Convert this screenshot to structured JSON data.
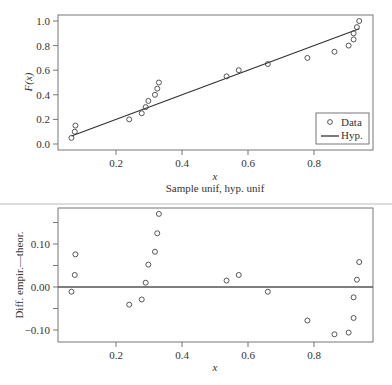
{
  "chart_data": [
    {
      "type": "scatter",
      "title": "",
      "subtitle": "Sample unif, hyp. unif",
      "xlabel": "x",
      "ylabel": "F(x)",
      "xlim": [
        0.04,
        0.97
      ],
      "ylim": [
        -0.02,
        1.02
      ],
      "xticks": [
        0.2,
        0.4,
        0.6,
        0.8
      ],
      "xtick_labels": [
        "0.2",
        "0.4",
        "0.6",
        "0.8"
      ],
      "yticks": [
        0.0,
        0.2,
        0.4,
        0.6,
        0.8,
        1.0
      ],
      "ytick_labels": [
        "0.0",
        "0.2",
        "0.4",
        "0.6",
        "0.8",
        "1.0"
      ],
      "grid": false,
      "legend_position": "lower right",
      "series": [
        {
          "name": "Data",
          "style": "open-circle",
          "x": [
            0.065,
            0.075,
            0.077,
            0.24,
            0.278,
            0.29,
            0.298,
            0.318,
            0.325,
            0.33,
            0.535,
            0.572,
            0.66,
            0.78,
            0.862,
            0.905,
            0.92,
            0.92,
            0.93,
            0.937
          ],
          "y": [
            0.05,
            0.1,
            0.15,
            0.2,
            0.25,
            0.3,
            0.35,
            0.4,
            0.45,
            0.5,
            0.55,
            0.6,
            0.65,
            0.7,
            0.75,
            0.8,
            0.85,
            0.9,
            0.95,
            1.0
          ]
        },
        {
          "name": "Hyp.",
          "style": "line",
          "x": [
            0.065,
            0.937
          ],
          "y": [
            0.065,
            0.937
          ]
        }
      ]
    },
    {
      "type": "scatter",
      "title": "",
      "xlabel": "x",
      "ylabel": "Diff. empir.—theor.",
      "xlim": [
        0.04,
        0.97
      ],
      "ylim": [
        -0.125,
        0.185
      ],
      "xticks": [
        0.2,
        0.4,
        0.6,
        0.8
      ],
      "xtick_labels": [
        "0.2",
        "0.4",
        "0.6",
        "0.8"
      ],
      "yticks": [
        -0.1,
        -0.05,
        0.0,
        0.05,
        0.1,
        0.15
      ],
      "ytick_labels": [
        "−0.10",
        "",
        "0.00",
        "",
        "0.10",
        ""
      ],
      "grid": false,
      "reference_line": 0.0,
      "series": [
        {
          "name": "Difference",
          "style": "open-circle",
          "x": [
            0.065,
            0.075,
            0.077,
            0.24,
            0.278,
            0.29,
            0.298,
            0.318,
            0.325,
            0.33,
            0.535,
            0.572,
            0.66,
            0.78,
            0.862,
            0.905,
            0.92,
            0.92,
            0.93,
            0.937
          ],
          "y": [
            -0.011,
            0.028,
            0.076,
            -0.041,
            -0.029,
            0.01,
            0.052,
            0.082,
            0.125,
            0.17,
            0.015,
            0.028,
            -0.011,
            -0.078,
            -0.11,
            -0.106,
            -0.072,
            -0.024,
            0.017,
            0.058
          ]
        }
      ]
    }
  ],
  "labels": {
    "top_ylabel": "F(x)",
    "top_xlabel": "x",
    "top_caption": "Sample unif, hyp. unif",
    "bottom_ylabel": "Diff. empir.—theor.",
    "bottom_xlabel": "x",
    "legend_data": "Data",
    "legend_hyp": "Hyp."
  }
}
